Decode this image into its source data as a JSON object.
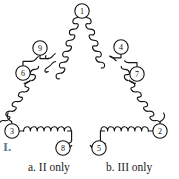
{
  "figure": {
    "name": "coil-triangle-circuit",
    "description_label": "I.",
    "label_color": "#5b7a96",
    "stroke_color": "#141414",
    "background": "#ffffff",
    "nodes": [
      {
        "id": "1",
        "label": "1",
        "cx": 82,
        "cy": 11,
        "r": 7.2
      },
      {
        "id": "2",
        "label": "2",
        "cx": 160,
        "cy": 131,
        "r": 7.2
      },
      {
        "id": "3",
        "label": "3",
        "cx": 12,
        "cy": 131,
        "r": 7.2
      },
      {
        "id": "4",
        "label": "4",
        "cx": 121,
        "cy": 47,
        "r": 7.2
      },
      {
        "id": "5",
        "label": "5",
        "cx": 99,
        "cy": 148,
        "r": 7.2
      },
      {
        "id": "6",
        "label": "6",
        "cx": 23,
        "cy": 73,
        "r": 7.2
      },
      {
        "id": "7",
        "label": "7",
        "cx": 137,
        "cy": 74,
        "r": 7.2
      },
      {
        "id": "8",
        "label": "8",
        "cx": 63,
        "cy": 148,
        "r": 7.2
      },
      {
        "id": "9",
        "label": "9",
        "cx": 40,
        "cy": 48,
        "r": 7.2
      }
    ],
    "coils": [
      {
        "name": "coil-left-upper-1-to-9",
        "from": "1",
        "to": "9"
      },
      {
        "name": "coil-left-lower-6-to-3",
        "from": "6",
        "to": "3"
      },
      {
        "name": "coil-right-upper-1-to-4",
        "from": "1",
        "to": "4"
      },
      {
        "name": "coil-right-lower-7-to-2",
        "from": "7",
        "to": "2"
      },
      {
        "name": "coil-bottom-left-3-to-8",
        "from": "3",
        "to": "8"
      },
      {
        "name": "coil-bottom-right-5-to-2",
        "from": "5",
        "to": "2"
      }
    ]
  },
  "choices": {
    "a": "a. II only",
    "b": "b. III only"
  }
}
